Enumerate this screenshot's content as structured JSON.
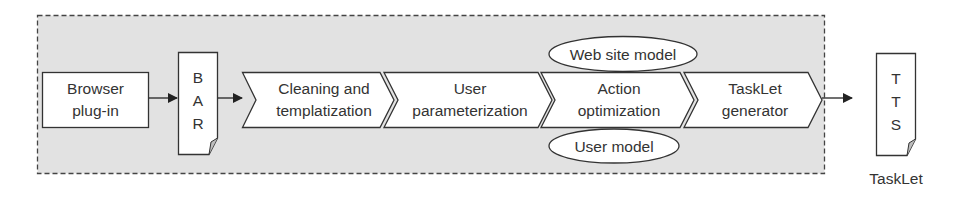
{
  "diagram": {
    "colors": {
      "container_fill": "#e2e2e2",
      "stroke": "#333333",
      "shape_fill": "#ffffff",
      "text": "#333333"
    },
    "browser_plugin": {
      "line1": "Browser",
      "line2": "plug-in"
    },
    "bar_document": {
      "letters": [
        "B",
        "A",
        "R"
      ]
    },
    "pipeline": [
      {
        "line1": "Cleaning and",
        "line2": "templatization"
      },
      {
        "line1": "User",
        "line2": "parameterization"
      },
      {
        "line1": "Action",
        "line2": "optimization"
      },
      {
        "line1": "TaskLet",
        "line2": "generator"
      }
    ],
    "models": {
      "top": "Web site model",
      "bottom": "User model"
    },
    "output_document": {
      "letters": [
        "T",
        "T",
        "S"
      ],
      "caption": "TaskLet"
    }
  }
}
